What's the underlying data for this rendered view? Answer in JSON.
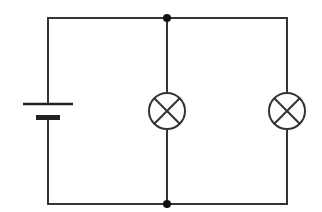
{
  "diagram": {
    "type": "electrical-circuit-schematic",
    "background": "#ffffff",
    "line_color": "#333333",
    "components": [
      {
        "id": "battery",
        "kind": "cell",
        "label": ""
      },
      {
        "id": "lamp-1",
        "kind": "lamp",
        "label": ""
      },
      {
        "id": "lamp-2",
        "kind": "lamp",
        "label": ""
      },
      {
        "id": "junction-top",
        "kind": "junction-node",
        "label": ""
      },
      {
        "id": "junction-bottom",
        "kind": "junction-node",
        "label": ""
      }
    ],
    "topology": "battery in series with two lamps connected in parallel"
  }
}
